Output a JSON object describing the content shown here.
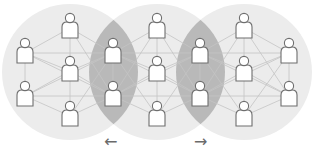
{
  "diagram": {
    "colors": {
      "background": "#ffffff",
      "circle_fill": "#ececec",
      "overlap_fill": "#b9b9b9",
      "edge_stroke": "#c4c4c4",
      "person_stroke": "#6e6e6e",
      "person_fill": "#ffffff",
      "arrow": "#6a6a6a"
    },
    "circles": [
      {
        "id": "community-left",
        "cx": 70,
        "cy": 72,
        "r": 68
      },
      {
        "id": "community-center",
        "cx": 157,
        "cy": 72,
        "r": 68
      },
      {
        "id": "community-right",
        "cx": 244,
        "cy": 72,
        "r": 68
      }
    ],
    "people": [
      {
        "id": "p1",
        "x": 70,
        "y": 28
      },
      {
        "id": "p2",
        "x": 25,
        "y": 53
      },
      {
        "id": "p3",
        "x": 25,
        "y": 96
      },
      {
        "id": "p4",
        "x": 70,
        "y": 71
      },
      {
        "id": "p5",
        "x": 70,
        "y": 116
      },
      {
        "id": "p6",
        "x": 113,
        "y": 53
      },
      {
        "id": "p7",
        "x": 113,
        "y": 96
      },
      {
        "id": "p8",
        "x": 157,
        "y": 28
      },
      {
        "id": "p9",
        "x": 157,
        "y": 71
      },
      {
        "id": "p10",
        "x": 157,
        "y": 116
      },
      {
        "id": "p11",
        "x": 200,
        "y": 53
      },
      {
        "id": "p12",
        "x": 200,
        "y": 96
      },
      {
        "id": "p13",
        "x": 244,
        "y": 28
      },
      {
        "id": "p14",
        "x": 244,
        "y": 71
      },
      {
        "id": "p15",
        "x": 244,
        "y": 116
      },
      {
        "id": "p16",
        "x": 289,
        "y": 53
      },
      {
        "id": "p17",
        "x": 289,
        "y": 96
      }
    ],
    "edges": [
      [
        "p2",
        "p3"
      ],
      [
        "p2",
        "p1"
      ],
      [
        "p2",
        "p6"
      ],
      [
        "p2",
        "p4"
      ],
      [
        "p2",
        "p7"
      ],
      [
        "p3",
        "p4"
      ],
      [
        "p3",
        "p5"
      ],
      [
        "p3",
        "p7"
      ],
      [
        "p3",
        "p6"
      ],
      [
        "p1",
        "p4"
      ],
      [
        "p1",
        "p6"
      ],
      [
        "p1",
        "p7"
      ],
      [
        "p4",
        "p5"
      ],
      [
        "p4",
        "p6"
      ],
      [
        "p4",
        "p7"
      ],
      [
        "p5",
        "p6"
      ],
      [
        "p5",
        "p7"
      ],
      [
        "p6",
        "p7"
      ],
      [
        "p6",
        "p8"
      ],
      [
        "p6",
        "p9"
      ],
      [
        "p6",
        "p10"
      ],
      [
        "p6",
        "p11"
      ],
      [
        "p6",
        "p12"
      ],
      [
        "p7",
        "p8"
      ],
      [
        "p7",
        "p9"
      ],
      [
        "p7",
        "p10"
      ],
      [
        "p7",
        "p11"
      ],
      [
        "p7",
        "p12"
      ],
      [
        "p8",
        "p9"
      ],
      [
        "p9",
        "p10"
      ],
      [
        "p8",
        "p11"
      ],
      [
        "p8",
        "p12"
      ],
      [
        "p10",
        "p11"
      ],
      [
        "p10",
        "p12"
      ],
      [
        "p9",
        "p11"
      ],
      [
        "p9",
        "p12"
      ],
      [
        "p11",
        "p12"
      ],
      [
        "p11",
        "p13"
      ],
      [
        "p11",
        "p14"
      ],
      [
        "p11",
        "p15"
      ],
      [
        "p11",
        "p16"
      ],
      [
        "p11",
        "p17"
      ],
      [
        "p12",
        "p13"
      ],
      [
        "p12",
        "p14"
      ],
      [
        "p12",
        "p15"
      ],
      [
        "p12",
        "p16"
      ],
      [
        "p12",
        "p17"
      ],
      [
        "p13",
        "p14"
      ],
      [
        "p14",
        "p15"
      ],
      [
        "p13",
        "p16"
      ],
      [
        "p13",
        "p17"
      ],
      [
        "p15",
        "p16"
      ],
      [
        "p15",
        "p17"
      ],
      [
        "p14",
        "p16"
      ],
      [
        "p14",
        "p17"
      ],
      [
        "p16",
        "p17"
      ]
    ],
    "arrows": {
      "left": {
        "glyph": "←",
        "x": 104,
        "y": 134
      },
      "right": {
        "glyph": "→",
        "x": 194,
        "y": 134
      }
    }
  }
}
